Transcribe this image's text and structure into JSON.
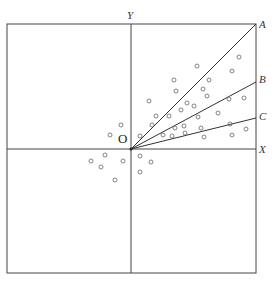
{
  "diagram": {
    "labels": {
      "y_axis": "Y",
      "x_axis": "X",
      "origin": "O",
      "line_a": "A",
      "line_b": "B",
      "line_c": "C"
    },
    "frame": {
      "left": 7,
      "top": 24,
      "right": 256,
      "bottom": 273
    },
    "origin": {
      "x": 131,
      "y": 149
    },
    "lines": [
      {
        "name": "A",
        "x2": 256,
        "y2": 24
      },
      {
        "name": "B",
        "x2": 256,
        "y2": 82
      },
      {
        "name": "C",
        "x2": 256,
        "y2": 118
      }
    ],
    "points": [
      [
        197,
        66
      ],
      [
        239,
        57
      ],
      [
        232,
        71
      ],
      [
        174,
        80
      ],
      [
        209,
        80
      ],
      [
        203,
        89
      ],
      [
        176,
        91
      ],
      [
        207,
        96
      ],
      [
        149,
        101
      ],
      [
        187,
        103
      ],
      [
        194,
        106
      ],
      [
        229,
        99
      ],
      [
        244,
        98
      ],
      [
        181,
        110
      ],
      [
        156,
        116
      ],
      [
        169,
        116
      ],
      [
        198,
        117
      ],
      [
        218,
        113
      ],
      [
        175,
        128
      ],
      [
        184,
        126
      ],
      [
        201,
        128
      ],
      [
        230,
        124
      ],
      [
        246,
        129
      ],
      [
        152,
        125
      ],
      [
        163,
        135
      ],
      [
        172,
        136
      ],
      [
        185,
        133
      ],
      [
        204,
        137
      ],
      [
        232,
        135
      ],
      [
        121,
        125
      ],
      [
        110,
        135
      ],
      [
        140,
        136
      ],
      [
        105,
        155
      ],
      [
        91,
        161
      ],
      [
        101,
        167
      ],
      [
        123,
        161
      ],
      [
        140,
        156
      ],
      [
        151,
        162
      ],
      [
        140,
        172
      ],
      [
        115,
        180
      ]
    ],
    "colors": {
      "line": "#333333",
      "point": "#666666"
    }
  }
}
